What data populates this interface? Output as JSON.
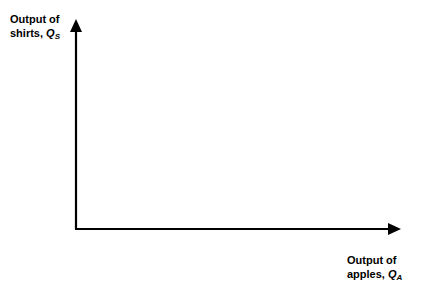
{
  "diagram": {
    "type": "empty production possibilities axes",
    "y_axis": {
      "label_line1": "Output of",
      "label_line2": "shirts, ",
      "symbol": "Q",
      "subscript": "S"
    },
    "x_axis": {
      "label_line1": "Output of",
      "label_line2": "apples, ",
      "symbol": "Q",
      "subscript": "A"
    },
    "colors": {
      "axis": "#000000",
      "background": "#ffffff"
    }
  }
}
